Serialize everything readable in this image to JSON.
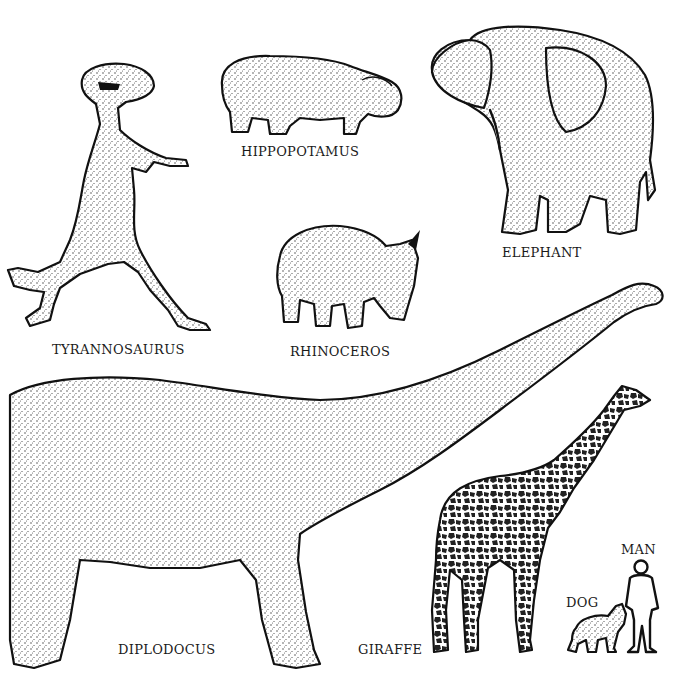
{
  "animals": {
    "tyrannosaurus": {
      "label": "TYRANNOSAURUS"
    },
    "hippopotamus": {
      "label": "HIPPOPOTAMUS"
    },
    "elephant": {
      "label": "ELEPHANT"
    },
    "rhinoceros": {
      "label": "RHINOCEROS"
    },
    "diplodocus": {
      "label": "DIPLODOCUS"
    },
    "giraffe": {
      "label": "GIRAFFE"
    },
    "dog": {
      "label": "DOG"
    },
    "man": {
      "label": "MAN"
    }
  },
  "colors": {
    "ink": "#111111",
    "background": "#ffffff"
  }
}
